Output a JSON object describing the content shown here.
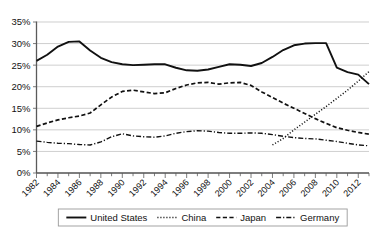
{
  "chart_data": {
    "type": "line",
    "title": "",
    "subtitle": "",
    "xlabel": "",
    "ylabel": "",
    "grid": true,
    "legend_position": "bottom",
    "ylim": [
      0,
      35
    ],
    "yticks": [
      0,
      5,
      10,
      15,
      20,
      25,
      30,
      35
    ],
    "ytick_labels": [
      "0%",
      "5%",
      "10%",
      "15%",
      "20%",
      "25%",
      "30%",
      "35%"
    ],
    "xlim": [
      1982,
      2013
    ],
    "x": [
      1982,
      1983,
      1984,
      1985,
      1986,
      1987,
      1988,
      1989,
      1990,
      1991,
      1992,
      1993,
      1994,
      1995,
      1996,
      1997,
      1998,
      1999,
      2000,
      2001,
      2002,
      2003,
      2004,
      2005,
      2006,
      2007,
      2008,
      2009,
      2010,
      2011,
      2012,
      2013
    ],
    "xtick_labels": [
      "1982",
      "1984",
      "1986",
      "1988",
      "1990",
      "1992",
      "1994",
      "1996",
      "1998",
      "2000",
      "2002",
      "2004",
      "2006",
      "2008",
      "2010",
      "2012"
    ],
    "xtick_years": [
      1982,
      1984,
      1986,
      1988,
      1990,
      1992,
      1994,
      1996,
      1998,
      2000,
      2002,
      2004,
      2006,
      2008,
      2010,
      2012
    ],
    "series": [
      {
        "name": "United States",
        "style": "solid",
        "color": "#111111",
        "values": [
          26.0,
          27.4,
          29.3,
          30.4,
          30.5,
          28.4,
          26.7,
          25.7,
          25.2,
          25.0,
          25.1,
          25.2,
          25.2,
          24.4,
          23.8,
          23.7,
          24.0,
          24.6,
          25.2,
          25.1,
          24.8,
          25.5,
          26.9,
          28.5,
          29.6,
          30.0,
          30.1,
          30.1,
          24.4,
          23.4,
          22.8,
          20.6
        ]
      },
      {
        "name": "China",
        "style": "dotted",
        "color": "#111111",
        "values": [
          null,
          null,
          null,
          null,
          null,
          null,
          null,
          null,
          null,
          null,
          null,
          null,
          null,
          null,
          null,
          null,
          null,
          null,
          null,
          null,
          null,
          null,
          6.5,
          8.0,
          10.0,
          11.8,
          13.6,
          15.4,
          17.3,
          19.2,
          21.3,
          23.5
        ]
      },
      {
        "name": "Japan",
        "style": "dashed",
        "color": "#111111",
        "values": [
          10.8,
          11.6,
          12.3,
          12.8,
          13.2,
          13.9,
          15.8,
          17.6,
          18.9,
          19.2,
          18.8,
          18.4,
          18.6,
          19.6,
          20.4,
          20.9,
          21.0,
          20.6,
          20.9,
          21.0,
          20.3,
          18.8,
          17.5,
          16.2,
          15.0,
          13.8,
          12.6,
          11.5,
          10.5,
          9.9,
          9.4,
          9.0
        ]
      },
      {
        "name": "Germany",
        "style": "dashdot",
        "color": "#111111",
        "values": [
          7.4,
          7.1,
          6.9,
          6.8,
          6.6,
          6.5,
          7.2,
          8.4,
          9.1,
          8.6,
          8.4,
          8.3,
          8.6,
          9.2,
          9.6,
          9.8,
          9.7,
          9.4,
          9.2,
          9.2,
          9.3,
          9.2,
          8.9,
          8.5,
          8.2,
          8.0,
          7.9,
          7.6,
          7.3,
          6.9,
          6.5,
          6.3
        ]
      }
    ]
  },
  "legend": {
    "entries": [
      {
        "label": "United States",
        "style": "solid"
      },
      {
        "label": "China",
        "style": "dotted"
      },
      {
        "label": "Japan",
        "style": "dashed"
      },
      {
        "label": "Germany",
        "style": "dashdot"
      }
    ]
  }
}
